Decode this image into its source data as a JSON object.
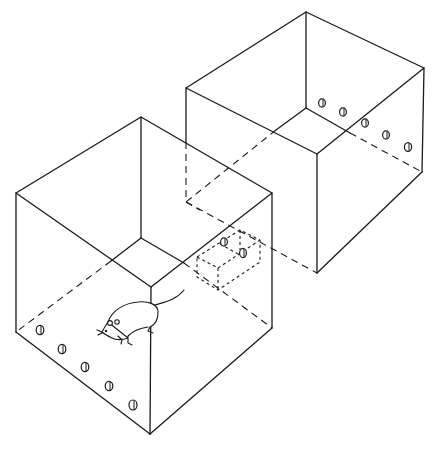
{
  "figure": {
    "description": "Isometric line drawing of two open-top transparent boxes connected by a tunnel, with a rat in the front box and nose-poke holes along the walls",
    "stroke_color": "#1a1a1a",
    "background": "#ffffff"
  },
  "components": {
    "front_box": {
      "label": "front-chamber",
      "hole_count": 5,
      "contains": "rat"
    },
    "back_box": {
      "label": "back-chamber",
      "hole_count": 5
    },
    "tunnel": {
      "label": "connecting-tunnel",
      "hole_count": 2
    }
  }
}
